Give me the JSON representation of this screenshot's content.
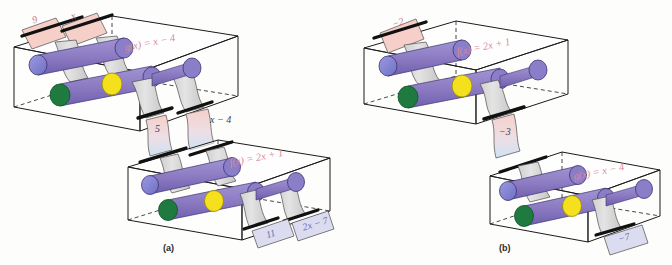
{
  "figure": {
    "panels": [
      {
        "caption": "(a)",
        "machines": [
          {
            "id": "machine-a-top",
            "formula": "g(x) = x − 4",
            "inputs": [
              {
                "value": "9",
                "color": "#f6cfc9"
              },
              {
                "value": "x",
                "color": "#f6cfc9"
              }
            ],
            "outputs": [
              {
                "value": "5",
                "color": "#f6cfc9"
              },
              {
                "value": "x − 4",
                "color": "#f6cfc9"
              }
            ]
          },
          {
            "id": "machine-a-bottom",
            "formula": "f(x) = 2x + 1",
            "inputs": [
              {
                "value": "5",
                "color": "#cfe2f2"
              },
              {
                "value": "x − 4",
                "color": "#cfe2f2"
              }
            ],
            "outputs": [
              {
                "value": "11",
                "color": "#dcdcf0"
              },
              {
                "value": "2x − 7",
                "color": "#dcdcf0"
              }
            ]
          }
        ]
      },
      {
        "caption": "(b)",
        "machines": [
          {
            "id": "machine-b-top",
            "formula": "f(x) = 2x + 1",
            "inputs": [
              {
                "value": "−2",
                "color": "#f6cfc9"
              }
            ],
            "outputs": [
              {
                "value": "−3",
                "color": "#f6cfc9"
              }
            ]
          },
          {
            "id": "machine-b-bottom",
            "formula": "g(x) = x − 4",
            "inputs": [
              {
                "value": "−3",
                "color": "#cfe2f2"
              }
            ],
            "outputs": [
              {
                "value": "−7",
                "color": "#dcdcf0"
              }
            ]
          }
        ]
      }
    ],
    "colors": {
      "roller_purple": "#8d7cc4",
      "roller_violet": "#7b6bb8",
      "cap_green": "#1f7a3f",
      "cap_yellow": "#f4e01c",
      "cap_blue": "#7a7ad0",
      "paper_gray": "#d6d6d6",
      "paper_pink": "#f6cfc9",
      "paper_blue": "#cfe2f2",
      "box_outline": "#1a1a1a",
      "formula_pink": "#d98a9a",
      "bar_black": "#111111"
    },
    "label_positions": {
      "a_top_formula": {
        "x": 124,
        "y": 37
      },
      "a_mid_5": {
        "x": 169,
        "y": 124
      },
      "a_mid_xminus4": {
        "x": 210,
        "y": 116
      },
      "a_bottom_formula": {
        "x": 229,
        "y": 154
      },
      "a_out_11": {
        "x": 278,
        "y": 222
      },
      "a_out_2x7": {
        "x": 310,
        "y": 217
      },
      "b_top_formula": {
        "x": 456,
        "y": 43
      },
      "b_mid_minus3": {
        "x": 509,
        "y": 127
      },
      "b_bottom_formula": {
        "x": 573,
        "y": 168
      },
      "b_out_minus7": {
        "x": 630,
        "y": 230
      },
      "in_9": {
        "x": 32,
        "y": 14
      },
      "in_x": {
        "x": 71,
        "y": 10
      },
      "in_minus2": {
        "x": 390,
        "y": 18
      },
      "cap_a": {
        "x": 163,
        "y": 243
      },
      "cap_b": {
        "x": 499,
        "y": 243
      }
    }
  }
}
